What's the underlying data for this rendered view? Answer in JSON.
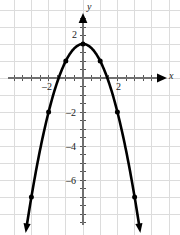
{
  "figure": {
    "title": "",
    "background_color": "#ffffff",
    "grid_color": "#dcdcdc",
    "axis_color": "#808080",
    "curve_color": "#000000",
    "width": 180,
    "height": 235
  },
  "axes": {
    "x_label": "x",
    "y_label": "y",
    "x_tick_labels": [
      "–2",
      "2"
    ],
    "y_tick_labels": [
      "2",
      "–2",
      "–4",
      "–6"
    ]
  },
  "chart_data": {
    "type": "line",
    "title": "",
    "xlabel": "x",
    "ylabel": "y",
    "grid": true,
    "legend": null,
    "xlim": [
      -4.6,
      5.5
    ],
    "ylim": [
      -8.8,
      4.5
    ],
    "xticks": [
      -2,
      2
    ],
    "yticks": [
      2,
      -2,
      -4,
      -6
    ],
    "xtick_labels": [
      "–2",
      "2"
    ],
    "ytick_labels": [
      "2",
      "–2",
      "–4",
      "–6"
    ],
    "minor_tick_interval": 0.5,
    "grid_interval": 1,
    "series": [
      {
        "name": "parabola",
        "equation": "y = -x^2 + 2",
        "color": "#000000",
        "line_width": 2.6,
        "arrow_start": true,
        "arrow_end": true,
        "x": [
          -3.0,
          -2.5,
          -2.0,
          -1.5,
          -1.0,
          -0.5,
          0.0,
          0.5,
          1.0,
          1.5,
          2.0,
          2.5,
          3.0
        ],
        "y": [
          -7.0,
          -4.25,
          -2.0,
          -0.25,
          1.0,
          1.75,
          2.0,
          1.75,
          1.0,
          -0.25,
          -2.0,
          -4.25,
          -7.0
        ]
      }
    ],
    "marked_points": [
      {
        "x": -3,
        "y": -7
      },
      {
        "x": -2,
        "y": -2
      },
      {
        "x": -1,
        "y": 1
      },
      {
        "x": 0,
        "y": 2
      },
      {
        "x": 1,
        "y": 1
      },
      {
        "x": 2,
        "y": -2
      },
      {
        "x": 3,
        "y": -7
      }
    ]
  }
}
